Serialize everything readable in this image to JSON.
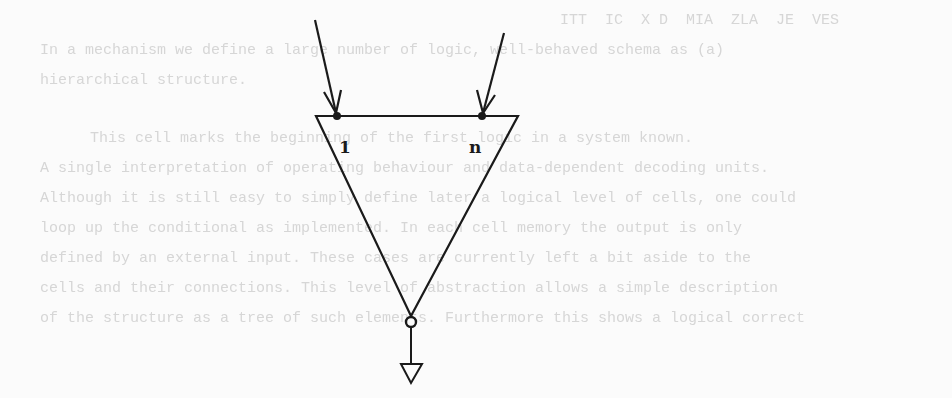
{
  "background_text": {
    "lines": [
      {
        "text": "ITT  IC  X D  MIA  ZLA  JE  VES",
        "x": 0,
        "y": 6
      },
      {
        "text": "In a mechanism we define a large number of logic, well-behaved schema as (a)",
        "x": 40,
        "y": 36
      },
      {
        "text": "hierarchical structure.",
        "x": 40,
        "y": 66
      },
      {
        "text": "This cell marks the beginning of the first logic in a system known.",
        "x": 90,
        "y": 124
      },
      {
        "text": "A single interpretation of operating behaviour and data-dependent decoding units.",
        "x": 40,
        "y": 154
      },
      {
        "text": "Although it is still easy to simply define later a logical level of cells, one could",
        "x": 40,
        "y": 184
      },
      {
        "text": "loop up the conditional as implemented. In each cell memory the output is only",
        "x": 40,
        "y": 214
      },
      {
        "text": "defined by an external input. These cases are currently left a bit aside to the",
        "x": 40,
        "y": 244
      },
      {
        "text": "cells and their connections. This level of abstraction allows a simple description",
        "x": 40,
        "y": 274
      },
      {
        "text": "of the structure as a tree of such elements. Furthermore this shows a logical correct",
        "x": 40,
        "y": 304
      }
    ]
  },
  "diagram": {
    "labels": {
      "input_first": "1",
      "input_last": "n"
    },
    "stroke_color": "#1a1a1a",
    "inputs": [
      {
        "name": "input-1",
        "from": [
          315,
          20
        ],
        "to": [
          337,
          116
        ]
      },
      {
        "name": "input-n",
        "from": [
          504,
          33
        ],
        "to": [
          482,
          116
        ]
      }
    ],
    "triangle": {
      "points": [
        [
          316,
          116
        ],
        [
          518,
          116
        ],
        [
          411,
          316
        ]
      ]
    },
    "output_circle": {
      "cx": 411,
      "cy": 322,
      "r": 5
    },
    "output_stem": {
      "from": [
        411,
        327
      ],
      "to": [
        411,
        364
      ]
    },
    "output_terminal": {
      "points": [
        [
          401,
          364
        ],
        [
          422,
          364
        ],
        [
          411,
          383
        ]
      ]
    }
  }
}
